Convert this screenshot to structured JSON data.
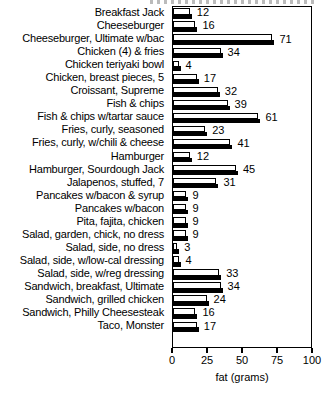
{
  "chart_data": {
    "type": "bar",
    "orientation": "horizontal",
    "title": "",
    "xlabel": "fat (grams)",
    "ylabel": "",
    "xlim": [
      0,
      100
    ],
    "xticks": [
      0,
      25,
      50,
      75,
      100
    ],
    "xtick_labels": [
      "0",
      "25",
      "50",
      "75",
      "100"
    ],
    "grid": false,
    "legend": false,
    "bar_style": "hollow-3d",
    "value_labels": true,
    "categories": [
      "Breakfast Jack",
      "Cheeseburger",
      "Cheeseburger, Ultimate w/bac",
      "Chicken (4) & fries",
      "Chicken teriyaki bowl",
      "Chicken, breast pieces, 5",
      "Croissant, Supreme",
      "Fish & chips",
      "Fish & chips w/tartar sauce",
      "Fries, curly, seasoned",
      "Fries, curly, w/chili & cheese",
      "Hamburger",
      "Hamburger, Sourdough Jack",
      "Jalapenos, stuffed, 7",
      "Pancakes w/bacon & syrup",
      "Pancakes w/bacon",
      "Pita, fajita, chicken",
      "Salad, garden, chick, no dress",
      "Salad, side, no dress",
      "Salad, side, w/low-cal dressing",
      "Salad, side, w/reg dressing",
      "Sandwich, breakfast, Ultimate",
      "Sandwich, grilled chicken",
      "Sandwich, Philly Cheesesteak",
      "Taco, Monster"
    ],
    "values": [
      12,
      16,
      71,
      34,
      4,
      17,
      32,
      39,
      61,
      23,
      41,
      12,
      45,
      31,
      9,
      9,
      9,
      9,
      3,
      4,
      33,
      34,
      24,
      16,
      17
    ]
  },
  "colors": {
    "bar_fill": "#ffffff",
    "bar_outline": "#000000",
    "bar_shadow": "#000000",
    "axis": "#000000",
    "text": "#000000",
    "background": "#ffffff"
  }
}
